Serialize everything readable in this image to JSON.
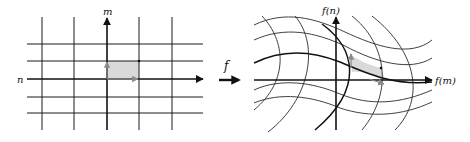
{
  "diagram": {
    "left_panel": {
      "horizontal_axis_label": "n",
      "vertical_axis_label": "m",
      "vertical_lines_x": [
        42,
        74,
        107,
        139,
        172
      ],
      "horizontal_lines_y": [
        44,
        61,
        79,
        97,
        113
      ],
      "shaded_cell": "unit cell between origin and (+1, +1)"
    },
    "mapping": {
      "label": "f",
      "arrow": "right"
    },
    "right_panel": {
      "horizontal_axis_label": "f(m)",
      "vertical_axis_label": "f(n)",
      "grid": "curvilinear (wave-shaped images of grid lines)",
      "shaded_cell": "image of the unit cell (skewed parallelogram)"
    },
    "colors": {
      "lines": "#1a1a1a",
      "shade": "#d9d9d9",
      "vectors": "#8a8a8a"
    }
  }
}
